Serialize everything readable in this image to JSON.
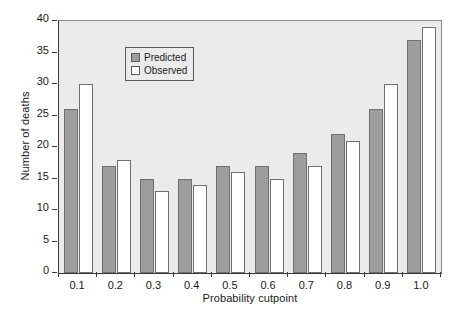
{
  "chart_data": {
    "type": "bar",
    "title": "",
    "xlabel": "Probability cutpoint",
    "ylabel": "Number of deaths",
    "categories": [
      "0.1",
      "0.2",
      "0.3",
      "0.4",
      "0.5",
      "0.6",
      "0.7",
      "0.8",
      "0.9",
      "1.0"
    ],
    "series": [
      {
        "name": "Predicted",
        "color": "#9d9d9d",
        "values": [
          26,
          17,
          15,
          15,
          17,
          17,
          19,
          22,
          26,
          37
        ]
      },
      {
        "name": "Observed",
        "color": "#ffffff",
        "values": [
          30,
          18,
          13,
          14,
          16,
          15,
          17,
          21,
          30,
          39
        ]
      }
    ],
    "ylim": [
      0,
      40
    ],
    "ytick_values": [
      0,
      5,
      10,
      15,
      20,
      25,
      30,
      35,
      40
    ],
    "ytick_labels": [
      "0",
      "5",
      "10",
      "15",
      "20",
      "25",
      "30",
      "35",
      "40"
    ],
    "grid": false,
    "legend_position": "top-left",
    "plot_background": "#ebebeb",
    "axis_color": "#3a3a3a"
  },
  "legend": {
    "entries": [
      {
        "label": "Predicted"
      },
      {
        "label": "Observed"
      }
    ]
  }
}
